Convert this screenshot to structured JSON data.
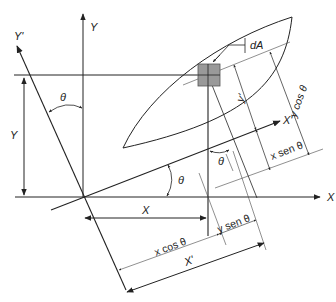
{
  "diagram": {
    "type": "rotation of coordinate axes for moment of inertia",
    "angle_symbol": "θ",
    "labels": {
      "x_axis": "X",
      "y_axis": "Y",
      "x_prime_axis": "X'",
      "y_prime_axis": "Y'",
      "area_element": "dA",
      "y_prime_dim": "y'",
      "y_cos": "y cos θ",
      "x_sen": "x sen θ",
      "y_sen": "y sen θ",
      "x_cos": "x cos θ",
      "x_dim": "X",
      "y_dim": "Y",
      "x_prime_dim": "X'",
      "theta_top": "θ",
      "theta_origin": "θ",
      "theta_element": "θ"
    },
    "colors": {
      "line": "#222222",
      "element_fill": "#999999",
      "background": "#ffffff"
    }
  }
}
